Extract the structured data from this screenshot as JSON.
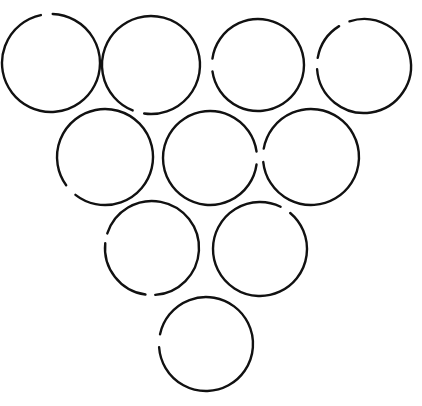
{
  "figure": {
    "shape_count": 10,
    "arrangement": "triangle-4-3-2-1",
    "canvas": {
      "width": 422,
      "height": 406,
      "background_color": "#ffffff"
    },
    "style": {
      "stroke_color": "#111111",
      "stroke_width": 2.4,
      "fill": "none"
    },
    "rows": [
      {
        "label": "row-1",
        "count": 4
      },
      {
        "label": "row-2",
        "count": 3
      },
      {
        "label": "row-3",
        "count": 2
      },
      {
        "label": "row-4",
        "count": 1
      }
    ]
  },
  "chart_data": {
    "type": "scatter",
    "xlabel": "",
    "ylabel": "",
    "xlim": [
      0,
      422
    ],
    "ylim": [
      0,
      406
    ],
    "grid": false,
    "legend": "none",
    "units": "pixels",
    "note": "Each circle is an open stroke; gaps are listed in degrees measured clockwise from the 3 o'clock direction in screen coordinates (y down).",
    "circles": [
      {
        "id": "circle-1",
        "row": 1,
        "index_in_row": 1,
        "cx": 51,
        "cy": 63,
        "r": 49,
        "stroke_width": 2.4,
        "gaps": [
          {
            "start": 258,
            "end": 272
          }
        ]
      },
      {
        "id": "circle-2",
        "row": 1,
        "index_in_row": 2,
        "cx": 151,
        "cy": 65,
        "r": 49,
        "stroke_width": 2.4,
        "gaps": [
          {
            "start": 98,
            "end": 112
          }
        ]
      },
      {
        "id": "circle-3",
        "row": 1,
        "index_in_row": 3,
        "cx": 258,
        "cy": 65,
        "r": 46,
        "stroke_width": 2.4,
        "gaps": [
          {
            "start": 172,
            "end": 188
          }
        ]
      },
      {
        "id": "circle-4",
        "row": 1,
        "index_in_row": 4,
        "cx": 364,
        "cy": 66,
        "r": 47,
        "stroke_width": 2.4,
        "gaps": [
          {
            "start": 238,
            "end": 252
          },
          {
            "start": 176,
            "end": 190
          }
        ]
      },
      {
        "id": "circle-5",
        "row": 2,
        "index_in_row": 1,
        "cx": 105,
        "cy": 157,
        "r": 48,
        "stroke_width": 2.4,
        "gaps": [
          {
            "start": 128,
            "end": 144
          }
        ]
      },
      {
        "id": "circle-6",
        "row": 2,
        "index_in_row": 2,
        "cx": 210,
        "cy": 158,
        "r": 47,
        "stroke_width": 2.4,
        "gaps": [
          {
            "start": 352,
            "end": 8
          }
        ]
      },
      {
        "id": "circle-7",
        "row": 2,
        "index_in_row": 3,
        "cx": 311,
        "cy": 157,
        "r": 48,
        "stroke_width": 2.4,
        "gaps": [
          {
            "start": 174,
            "end": 190
          }
        ]
      },
      {
        "id": "circle-8",
        "row": 3,
        "index_in_row": 1,
        "cx": 152,
        "cy": 248,
        "r": 47,
        "stroke_width": 2.4,
        "gaps": [
          {
            "start": 186,
            "end": 198
          },
          {
            "start": 86,
            "end": 98
          }
        ]
      },
      {
        "id": "circle-9",
        "row": 3,
        "index_in_row": 2,
        "cx": 260,
        "cy": 249,
        "r": 47,
        "stroke_width": 2.4,
        "gaps": [
          {
            "start": 296,
            "end": 310
          }
        ]
      },
      {
        "id": "circle-10",
        "row": 4,
        "index_in_row": 1,
        "cx": 206,
        "cy": 344,
        "r": 47,
        "stroke_width": 2.4,
        "gaps": [
          {
            "start": 176,
            "end": 192
          }
        ]
      }
    ]
  }
}
